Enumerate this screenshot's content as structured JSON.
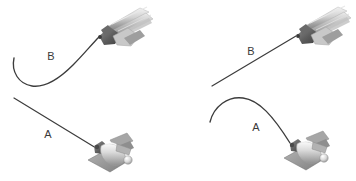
{
  "figure": {
    "type": "illustration",
    "background_color": "#ffffff",
    "width": 356,
    "height": 181,
    "panels": [
      {
        "id": "panel-left",
        "position": "left",
        "items": [
          {
            "label": "B",
            "label_x": 51,
            "label_y": 57,
            "wire_shape": "curved-j-hook",
            "wire_color": "#3c3c3c",
            "instrument": "needle-driver-handle",
            "instrument_position": "top-right"
          },
          {
            "label": "A",
            "label_x": 48,
            "label_y": 135,
            "wire_shape": "straight",
            "wire_color": "#3c3c3c",
            "instrument": "clip-applier-handle",
            "instrument_position": "bottom-right"
          }
        ]
      },
      {
        "id": "panel-right",
        "position": "right",
        "items": [
          {
            "label": "B",
            "label_x": 251,
            "label_y": 52,
            "wire_shape": "straight",
            "wire_color": "#3c3c3c",
            "instrument": "needle-driver-handle",
            "instrument_position": "top-right"
          },
          {
            "label": "A",
            "label_x": 256,
            "label_y": 128,
            "wire_shape": "curved-arch",
            "wire_color": "#3c3c3c",
            "instrument": "clip-applier-handle",
            "instrument_position": "bottom-right"
          }
        ]
      }
    ],
    "colors": {
      "wire": "#3c3c3c",
      "label_text": "#3a3a3a",
      "instrument_light": "#d8d8d8",
      "instrument_mid": "#a8a8a8",
      "instrument_dark": "#6e6e6e",
      "instrument_darkest": "#4a4a4a",
      "highlight": "#f2f2f2"
    }
  }
}
